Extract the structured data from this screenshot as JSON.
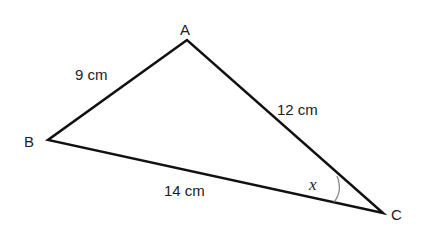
{
  "diagram": {
    "type": "triangle",
    "vertices": [
      {
        "name": "A",
        "label": "A"
      },
      {
        "name": "B",
        "label": "B"
      },
      {
        "name": "C",
        "label": "C"
      }
    ],
    "sides": {
      "AB": "9 cm",
      "AC": "12 cm",
      "BC": "14 cm"
    },
    "angle": {
      "at": "C",
      "label": "x"
    },
    "colors": {
      "line": "#111111",
      "arc": "#888888",
      "text": "#222222"
    }
  }
}
